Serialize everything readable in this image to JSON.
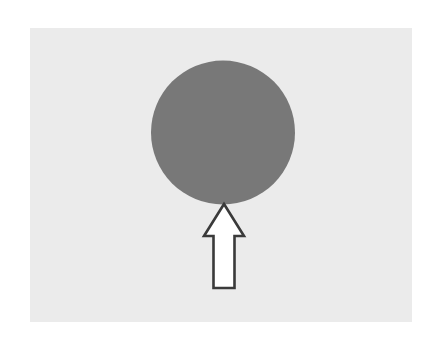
{
  "image": {
    "title": "Gray circle with upward pointing arrow",
    "description": "A large solid gray filled circle on a light gray rectangular panel, with a white outlined upward-pointing block arrow beneath it whose tip touches the bottom of the circle.",
    "width": 440,
    "height": 338,
    "outer_background_color": "#ffffff"
  },
  "panel": {
    "name": "light gray background panel",
    "fill_color": "#ebebeb",
    "x": 30,
    "y": 28,
    "width": 382,
    "height": 294
  },
  "shapes": {
    "circle": {
      "name": "gray circle",
      "fill_color": "#787878",
      "center_x": 223,
      "center_y": 132.5,
      "radius": 72,
      "left": 151,
      "right": 295,
      "top": 60.5,
      "bottom": 204.5
    },
    "arrow": {
      "name": "upward block arrow",
      "fill_color": "#ffffff",
      "stroke_color": "#3a3a3a",
      "stroke_width": 2.6,
      "direction": "up",
      "tip_x": 224,
      "tip_y": 204,
      "head_base_y": 236,
      "head_left_x": 204,
      "head_right_x": 244,
      "shaft_left_x": 213.5,
      "shaft_right_x": 234.5,
      "shaft_bottom_y": 288,
      "points": "224,204 244,236 234.5,236 234.5,288 213.5,288 213.5,236 204,236"
    }
  },
  "colors": {
    "white": "#ffffff",
    "panel_gray": "#ebebeb",
    "circle_gray": "#787878",
    "outline_dark": "#3a3a3a"
  }
}
